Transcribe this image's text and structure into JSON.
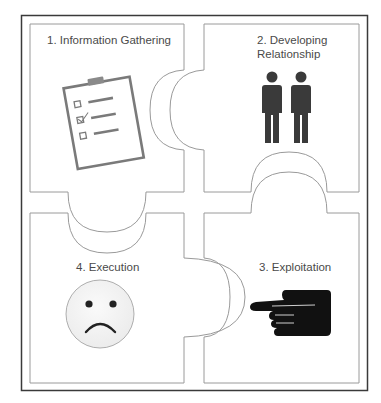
{
  "diagram": {
    "type": "puzzle",
    "colors": {
      "frame": "#3a3a3a",
      "piece_stroke": "#9a9a9a",
      "clipboard": "#7a7a7a",
      "people": "#3a3a3a",
      "hand": "#111111",
      "face_fill": "#f2f2f2",
      "face_stroke": "#9a9a9a",
      "face_features": "#222222",
      "text": "#4a4a4a"
    },
    "pieces": [
      {
        "position": "top-left",
        "step": 1,
        "label": "1. Information Gathering",
        "icon": "clipboard-checklist-icon"
      },
      {
        "position": "top-right",
        "step": 2,
        "label_line1": "2. Developing",
        "label_line2": "Relationship",
        "icon": "two-people-icon"
      },
      {
        "position": "bottom-right",
        "step": 3,
        "label": "3. Exploitation",
        "icon": "pointing-hand-icon"
      },
      {
        "position": "bottom-left",
        "step": 4,
        "label": "4. Execution",
        "icon": "sad-face-icon"
      }
    ]
  }
}
